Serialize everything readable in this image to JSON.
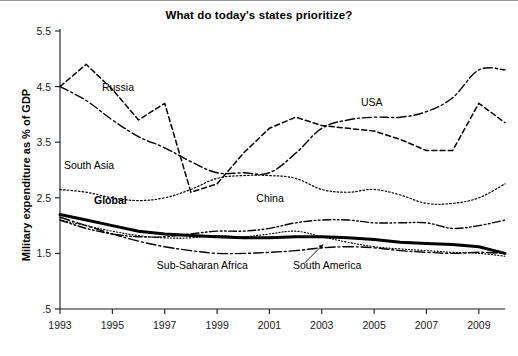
{
  "chart_data": {
    "type": "line",
    "title": "What do today's states prioritize?",
    "xlabel": "",
    "ylabel": "Military expenditure as % of GDP",
    "xlim": [
      1993,
      2010
    ],
    "ylim": [
      0.5,
      5.5
    ],
    "grid": false,
    "legend_position": "inline-annotations",
    "xticks": [
      "1993",
      "1995",
      "1997",
      "1999",
      "2001",
      "2003",
      "2005",
      "2007",
      "2009"
    ],
    "xtick_values": [
      1993,
      1995,
      1997,
      1999,
      2001,
      2003,
      2005,
      2007,
      2009
    ],
    "yticks": [
      "5.5",
      "4.5",
      "3.5",
      "2.5",
      "1.5",
      ".5"
    ],
    "ytick_values": [
      5.5,
      4.5,
      3.5,
      2.5,
      1.5,
      0.5
    ],
    "x": [
      1993,
      1994,
      1995,
      1996,
      1997,
      1998,
      1999,
      2000,
      2001,
      2002,
      2003,
      2004,
      2005,
      2006,
      2007,
      2008,
      2009,
      2010
    ],
    "series": [
      {
        "name": "Russia",
        "style": "dashed",
        "label": "Russia",
        "values": [
          4.5,
          4.9,
          4.45,
          3.9,
          4.2,
          2.6,
          2.75,
          3.3,
          3.75,
          3.95,
          3.8,
          3.75,
          3.7,
          3.55,
          3.35,
          3.35,
          4.2,
          3.85
        ]
      },
      {
        "name": "USA",
        "style": "dash-dot",
        "label": "USA",
        "values": [
          4.5,
          4.25,
          3.9,
          3.6,
          3.4,
          3.15,
          2.95,
          2.95,
          2.95,
          3.3,
          3.75,
          3.9,
          3.95,
          3.95,
          4.05,
          4.3,
          4.8,
          4.8
        ]
      },
      {
        "name": "South Asia",
        "style": "dotted",
        "label": "South Asia",
        "values": [
          2.65,
          2.6,
          2.5,
          2.45,
          2.5,
          2.65,
          2.85,
          2.9,
          2.9,
          2.85,
          2.65,
          2.6,
          2.65,
          2.55,
          2.4,
          2.4,
          2.5,
          2.75
        ]
      },
      {
        "name": "China",
        "style": "dash-dot-dot",
        "label": "China",
        "values": [
          2.1,
          1.95,
          1.85,
          1.8,
          1.8,
          1.85,
          1.9,
          1.9,
          1.95,
          2.05,
          2.1,
          2.1,
          2.05,
          2.05,
          2.05,
          1.95,
          2.0,
          2.1
        ]
      },
      {
        "name": "Global",
        "style": "solid-bold",
        "label": "Global",
        "values": [
          2.2,
          2.1,
          2.0,
          1.9,
          1.85,
          1.82,
          1.8,
          1.78,
          1.78,
          1.8,
          1.8,
          1.78,
          1.75,
          1.7,
          1.68,
          1.66,
          1.62,
          1.5
        ]
      },
      {
        "name": "Sub-Saharan Africa",
        "style": "long-dash-dot",
        "label": "Sub-Saharan Africa",
        "values": [
          2.15,
          2.0,
          1.85,
          1.72,
          1.62,
          1.55,
          1.5,
          1.5,
          1.52,
          1.55,
          1.6,
          1.62,
          1.6,
          1.55,
          1.52,
          1.5,
          1.52,
          1.5
        ]
      },
      {
        "name": "South America",
        "style": "fine-dotted",
        "label": "South America",
        "values": [
          2.1,
          2.0,
          1.9,
          1.82,
          1.78,
          1.78,
          1.82,
          1.8,
          1.85,
          1.9,
          1.8,
          1.7,
          1.62,
          1.58,
          1.55,
          1.52,
          1.5,
          1.45
        ]
      }
    ],
    "annotations": [
      {
        "text": "Russia",
        "x": 1994.6,
        "y": 4.42
      },
      {
        "text": "USA",
        "x": 2004.5,
        "y": 4.15
      },
      {
        "text": "South Asia",
        "x": 1993.15,
        "y": 3.02
      },
      {
        "text": "China",
        "x": 2000.5,
        "y": 2.42
      },
      {
        "text": "Global",
        "x": 1994.3,
        "y": 2.38
      },
      {
        "text": "Sub-Saharan Africa",
        "x": 1996.7,
        "y": 1.22
      },
      {
        "text": "South America",
        "x": 2001.9,
        "y": 1.22
      }
    ]
  },
  "colors": {
    "line": "#000000",
    "axis": "#1a1a1a",
    "background": "#ffffff",
    "title": "#000000"
  }
}
